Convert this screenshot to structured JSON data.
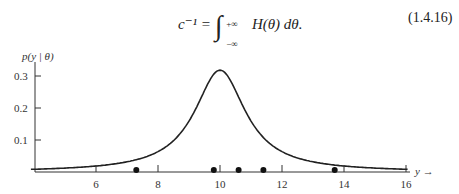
{
  "equation": {
    "lhs": "c⁻¹ =",
    "integral_upper": "+∞",
    "integral_lower": "−∞",
    "integrand": "H(θ) dθ.",
    "number": "(1.4.16)"
  },
  "chart_data": {
    "type": "line",
    "title": "",
    "xlabel": "y →",
    "ylabel": "p(y | θ)",
    "x_ticks": [
      "6",
      "8",
      "10",
      "12",
      "14",
      "16"
    ],
    "y_ticks": [
      "0.1",
      "0.2",
      "0.3"
    ],
    "xlim": [
      3.9,
      16.2
    ],
    "ylim": [
      0,
      0.36
    ],
    "grid": false,
    "series": [
      {
        "name": "Cauchy density p(y|θ), θ≈10",
        "curve": "cauchy",
        "center": 10,
        "scale": 1,
        "peak": 0.318
      }
    ],
    "observations": {
      "name": "sample points",
      "x": [
        7.3,
        9.8,
        10.6,
        11.4,
        13.7
      ],
      "y": [
        0,
        0,
        0,
        0,
        0
      ]
    }
  }
}
